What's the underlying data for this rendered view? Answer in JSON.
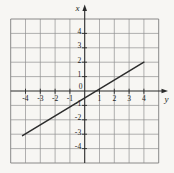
{
  "chart_data": {
    "type": "line",
    "title": "",
    "grid": true,
    "vertical_axis": {
      "label": "x",
      "range": [
        -5,
        5
      ],
      "tick_values": [
        -4,
        -3,
        -2,
        -1,
        1,
        2,
        3,
        4
      ],
      "tick_labels": [
        "-4",
        "-3",
        "-2",
        "-1",
        "1",
        "2",
        "3",
        "4"
      ]
    },
    "horizontal_axis": {
      "label": "y",
      "range": [
        -5,
        5
      ],
      "tick_values": [
        -4,
        -3,
        -2,
        -1,
        1,
        2,
        3,
        4
      ],
      "tick_labels": [
        "-4",
        "-3",
        "-2",
        "-1",
        "1",
        "2",
        "3",
        "4"
      ]
    },
    "origin_label": "0",
    "series": [
      {
        "name": "plotted-line",
        "points": [
          [
            -4.2,
            -3.1
          ],
          [
            4.0,
            2.0
          ]
        ],
        "slope": 0.625,
        "vertical_intercept": -0.5,
        "horizontal_intercept": 0.75
      }
    ],
    "colors": {
      "background": "#f7f6f3",
      "grid": "#909090",
      "axis": "#2a2a2a",
      "line": "#2c2c2c",
      "text": "#1d1d1d"
    }
  }
}
